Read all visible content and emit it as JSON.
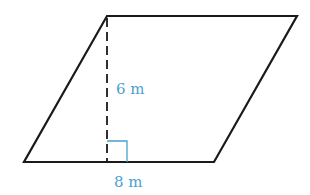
{
  "diagram": {
    "shape": "parallelogram",
    "height_label": "6 m",
    "base_label": "8 m",
    "colors": {
      "outline": "#1a1a1a",
      "annotation": "#4a9fd0"
    }
  }
}
